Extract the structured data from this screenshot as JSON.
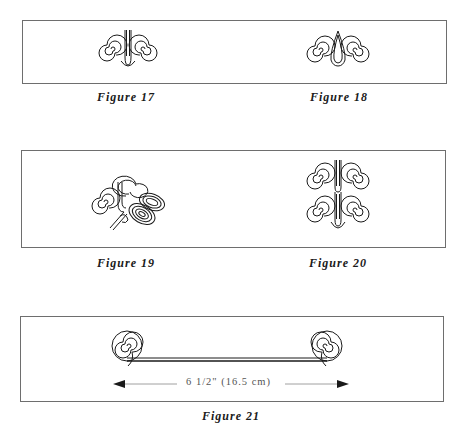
{
  "figures": [
    {
      "id": "fig17",
      "caption": "Figure 17",
      "description": "Two spirals joined by a U-shaped loop"
    },
    {
      "id": "fig18",
      "caption": "Figure 18",
      "description": "Two spirals joined by a teardrop loop"
    },
    {
      "id": "fig19",
      "caption": "Figure 19",
      "description": "Spirals with bent oval coils"
    },
    {
      "id": "fig20",
      "caption": "Figure 20",
      "description": "Four spirals arranged in two stacked pairs"
    },
    {
      "id": "fig21",
      "caption": "Figure 21",
      "description": "Wire with spirals coiled at both ends"
    }
  ],
  "measurement": {
    "label": "6 1/2\" (16.5 cm)",
    "inches": "6 1/2\"",
    "centimeters": "16.5 cm"
  },
  "colors": {
    "ink": "#1a1a1a",
    "border": "#6e6e6e",
    "measure_text": "#555555"
  }
}
